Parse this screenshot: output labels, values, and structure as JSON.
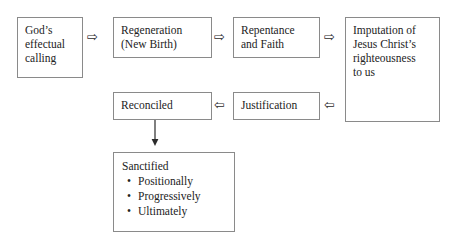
{
  "diagram": {
    "background_color": "#ffffff",
    "border_color": "#8a8a8a",
    "text_color": "#232323",
    "nodes": {
      "calling": {
        "lines": [
          "God’s",
          "effectual",
          "calling"
        ]
      },
      "regeneration": {
        "lines": [
          "Regeneration",
          "(New Birth)"
        ]
      },
      "repentance": {
        "lines": [
          "Repentance",
          "and Faith"
        ]
      },
      "imputation": {
        "lines": [
          "Imputation of",
          "Jesus Christ’s",
          "righteousness",
          "to us"
        ]
      },
      "reconciled": {
        "lines": [
          "Reconciled"
        ]
      },
      "justification": {
        "lines": [
          "Justification"
        ]
      },
      "sanctified": {
        "title": "Sanctified",
        "bullets": [
          "Positionally",
          "Progressively",
          "Ultimately"
        ]
      }
    },
    "arrows": {
      "calling_to_regeneration": {
        "glyph": "⇨",
        "direction": "right"
      },
      "regeneration_to_repentance": {
        "glyph": "⇨",
        "direction": "right"
      },
      "repentance_to_imputation": {
        "glyph": "⇨",
        "direction": "right"
      },
      "justification_to_reconciled": {
        "glyph": "⇦",
        "direction": "left"
      },
      "imputation_to_justification": {
        "glyph": "⇦",
        "direction": "left"
      },
      "reconciled_to_sanctified": {
        "glyph": "↓",
        "direction": "down"
      }
    }
  }
}
